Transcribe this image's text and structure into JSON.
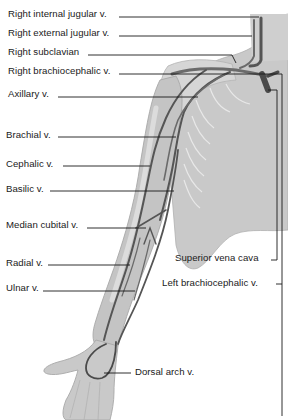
{
  "diagram": {
    "colors": {
      "background": "#ffffff",
      "body_fill": "#c9c9c9",
      "body_light": "#dadada",
      "body_edge": "#a8a8a8",
      "vein": "#555555",
      "vein_dark": "#3a3a3a",
      "leader_line": "#1a1a1a",
      "text": "#1a1a1a"
    },
    "labels_left": [
      {
        "id": "right-internal-jugular",
        "text": "Right internal jugular v.",
        "x": 8,
        "y": 8
      },
      {
        "id": "right-external-jugular",
        "text": "Right external jugular v.",
        "x": 8,
        "y": 27
      },
      {
        "id": "right-subclavian",
        "text": "Right subclavian",
        "x": 8,
        "y": 46
      },
      {
        "id": "right-brachiocephalic",
        "text": "Right brachiocephalic v.",
        "x": 8,
        "y": 65
      },
      {
        "id": "axillary",
        "text": "Axillary v.",
        "x": 8,
        "y": 88
      },
      {
        "id": "brachial",
        "text": "Brachial v.",
        "x": 6,
        "y": 129
      },
      {
        "id": "cephalic",
        "text": "Cephalic v.",
        "x": 6,
        "y": 158
      },
      {
        "id": "basilic",
        "text": "Basilic v.",
        "x": 6,
        "y": 183
      },
      {
        "id": "median-cubital",
        "text": "Median cubital v.",
        "x": 6,
        "y": 219
      },
      {
        "id": "radial",
        "text": "Radial v.",
        "x": 6,
        "y": 257
      },
      {
        "id": "ulnar",
        "text": "Ulnar v.",
        "x": 6,
        "y": 282
      }
    ],
    "labels_right": [
      {
        "id": "superior-vena-cava",
        "text": "Superior vena cava",
        "x": 175,
        "y": 252
      },
      {
        "id": "left-brachiocephalic",
        "text": "Left brachiocephalic v.",
        "x": 162,
        "y": 277
      },
      {
        "id": "dorsal-arch",
        "text": "Dorsal arch v.",
        "x": 135,
        "y": 367
      }
    ]
  }
}
